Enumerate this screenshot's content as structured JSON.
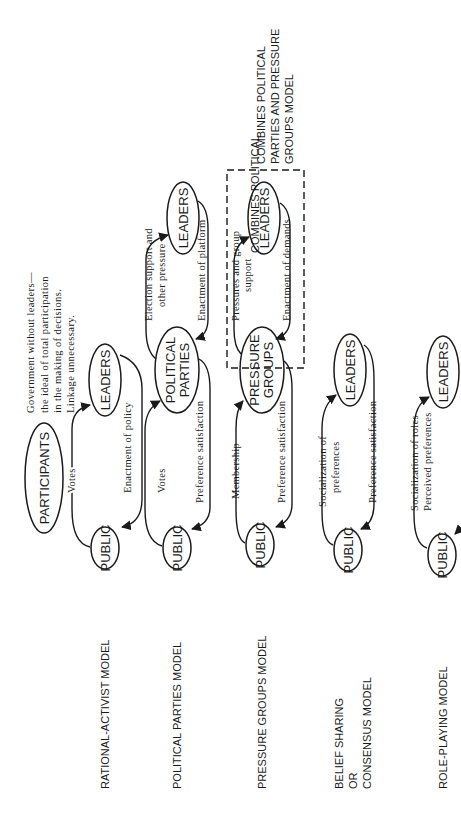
{
  "diagram": {
    "orientation": "rotated-90-ccw",
    "models": [
      {
        "id": "rational-activist",
        "label_lines": [
          "RATIONAL-ACTIVIST MODEL"
        ],
        "nodes": [
          "PUBLIC",
          "LEADERS"
        ],
        "top_edge": "Votes",
        "bottom_edge": "Enactment of policy"
      },
      {
        "id": "political-parties",
        "label_lines": [
          "POLITICAL PARTIES MODEL"
        ],
        "nodes": [
          "PUBLIC",
          "POLITICAL PARTIES",
          "LEADERS"
        ],
        "top_edge": "Votes",
        "bottom_edge": "Preference satisfaction",
        "top_edge_2": [
          "Election support and",
          "other pressure"
        ],
        "bottom_edge_2": "Enactment of platform"
      },
      {
        "id": "pressure-groups",
        "label_lines": [
          "PRESSURE GROUPS MODEL"
        ],
        "nodes": [
          "PUBLIC",
          "PRESSURE GROUPS",
          "LEADERS"
        ],
        "top_edge": "Membership",
        "bottom_edge": "Preference satisfaction",
        "top_edge_2": [
          "Pressures and group",
          "support"
        ],
        "bottom_edge_2": "Enactment of demands"
      },
      {
        "id": "belief-sharing",
        "label_lines": [
          "BELIEF SHARING",
          "OR",
          "CONSENSUS MODEL"
        ],
        "nodes": [
          "PUBLIC",
          "LEADERS"
        ],
        "top_edge": [
          "Socialization of",
          "preferences"
        ],
        "bottom_edge": "Preference satisfaction"
      },
      {
        "id": "role-playing",
        "label_lines": [
          "ROLE-PLAYING MODEL"
        ],
        "nodes": [
          "PUBLIC",
          "LEADERS"
        ],
        "top_edge": [
          "Socialization of roles",
          "Perceived preferences"
        ]
      }
    ],
    "participants": {
      "node": "PARTICIPANTS",
      "note_lines": [
        "Government without leaders—",
        "the ideal of total participation",
        "in the making of decisions.",
        "Linkage unnecessary."
      ]
    },
    "combined_box_note": [
      "COMBINES POLITICAL",
      "PARTIES AND PRESSURE",
      "GROUPS MODEL"
    ]
  }
}
